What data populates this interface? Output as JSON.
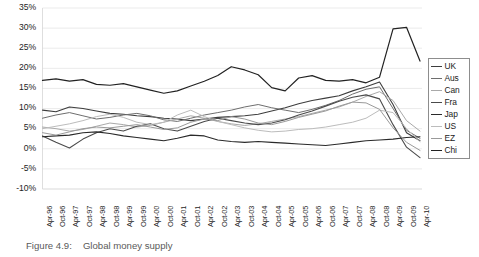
{
  "caption": {
    "number": "Figure 4.9:",
    "text": "Global money supply"
  },
  "chart_data": {
    "type": "line",
    "title": "Global money supply",
    "xlabel": "",
    "ylabel": "",
    "ylim": [
      -10,
      35
    ],
    "ytick_labels": [
      "35%",
      "30%",
      "25%",
      "20%",
      "15%",
      "10%",
      "5%",
      "0%",
      "-5%",
      "-10%"
    ],
    "ytick_values": [
      35,
      30,
      25,
      20,
      15,
      10,
      5,
      0,
      -5,
      -10
    ],
    "grid": true,
    "grid_axis": "y",
    "legend_position": "right",
    "x": [
      "Apr-96",
      "Oct-96",
      "Apr-97",
      "Oct-97",
      "Apr-98",
      "Oct-98",
      "Apr-99",
      "Oct-99",
      "Apr-00",
      "Oct-00",
      "Apr-01",
      "Oct-01",
      "Apr-02",
      "Oct-02",
      "Apr-03",
      "Oct-03",
      "Apr-04",
      "Oct-04",
      "Apr-05",
      "Oct-05",
      "Apr-06",
      "Oct-06",
      "Apr-07",
      "Oct-07",
      "Apr-08",
      "Oct-08",
      "Apr-09",
      "Oct-09",
      "Apr-10"
    ],
    "series": [
      {
        "name": "UK",
        "color": "#3d3d3d",
        "width": 1.1,
        "values": [
          9.6,
          9.2,
          10.4,
          10.0,
          9.4,
          8.8,
          8.6,
          8.2,
          8.0,
          7.6,
          7.4,
          7.0,
          7.4,
          7.8,
          8.0,
          8.2,
          8.6,
          9.4,
          10.2,
          11.2,
          12.0,
          12.6,
          13.2,
          14.4,
          15.4,
          16.6,
          11.0,
          4.0,
          2.0
        ]
      },
      {
        "name": "Aus",
        "color": "#6e6e6e",
        "width": 1.0,
        "values": [
          7.6,
          8.4,
          9.0,
          8.2,
          7.4,
          7.8,
          8.4,
          8.8,
          8.2,
          7.2,
          6.8,
          7.6,
          8.4,
          9.0,
          9.6,
          10.4,
          11.0,
          10.2,
          9.6,
          9.0,
          9.8,
          10.8,
          12.0,
          13.6,
          14.8,
          15.4,
          10.0,
          4.6,
          2.6
        ]
      },
      {
        "name": "Can",
        "color": "#a9a9a9",
        "width": 1.0,
        "values": [
          5.4,
          5.0,
          4.4,
          4.8,
          5.6,
          6.4,
          6.0,
          5.4,
          5.8,
          6.6,
          7.4,
          8.2,
          7.6,
          6.8,
          6.2,
          5.8,
          6.2,
          6.8,
          7.4,
          8.0,
          8.8,
          9.6,
          10.4,
          11.6,
          13.0,
          14.2,
          12.0,
          7.0,
          4.4
        ]
      },
      {
        "name": "Fra",
        "color": "#4a4a4a",
        "width": 1.1,
        "values": [
          3.2,
          1.6,
          0.2,
          2.4,
          4.0,
          5.0,
          4.4,
          5.6,
          6.2,
          5.0,
          4.4,
          5.6,
          6.8,
          7.6,
          7.0,
          6.4,
          6.0,
          6.4,
          7.2,
          8.4,
          9.4,
          10.6,
          11.8,
          12.8,
          13.4,
          12.4,
          6.0,
          0.4,
          -2.2
        ]
      },
      {
        "name": "Jap",
        "color": "#2a2a2a",
        "width": 1.1,
        "values": [
          3.0,
          3.2,
          3.4,
          4.0,
          4.2,
          3.8,
          3.2,
          2.8,
          2.4,
          2.0,
          2.6,
          3.4,
          3.2,
          2.2,
          1.8,
          1.6,
          1.8,
          1.6,
          1.4,
          1.2,
          1.0,
          0.8,
          1.2,
          1.6,
          2.0,
          2.2,
          2.4,
          2.8,
          3.0
        ]
      },
      {
        "name": "US",
        "color": "#bcbcbc",
        "width": 1.0,
        "values": [
          5.0,
          5.6,
          6.2,
          7.0,
          8.0,
          8.6,
          7.8,
          6.6,
          6.0,
          6.6,
          8.4,
          9.6,
          8.0,
          6.8,
          6.0,
          5.2,
          4.6,
          4.2,
          4.4,
          4.8,
          5.0,
          5.4,
          6.0,
          6.6,
          7.6,
          9.6,
          9.0,
          5.0,
          1.8
        ]
      },
      {
        "name": "EZ",
        "color": "#9a9a9a",
        "width": 1.0,
        "values": [
          4.0,
          3.4,
          4.2,
          5.0,
          5.4,
          5.2,
          5.6,
          6.0,
          5.4,
          4.8,
          5.2,
          6.6,
          7.4,
          7.0,
          8.0,
          7.4,
          6.4,
          6.0,
          6.8,
          7.8,
          8.6,
          9.4,
          10.6,
          11.6,
          11.4,
          9.8,
          5.2,
          1.6,
          -0.4
        ]
      },
      {
        "name": "Chi",
        "color": "#222222",
        "width": 1.2,
        "values": [
          17.0,
          17.4,
          16.8,
          17.2,
          16.0,
          15.8,
          16.2,
          15.4,
          14.6,
          13.8,
          14.4,
          15.6,
          16.8,
          18.2,
          20.4,
          19.6,
          18.4,
          15.2,
          14.4,
          17.6,
          18.2,
          17.0,
          16.8,
          17.2,
          16.4,
          17.8,
          29.8,
          30.2,
          21.8
        ]
      }
    ]
  }
}
